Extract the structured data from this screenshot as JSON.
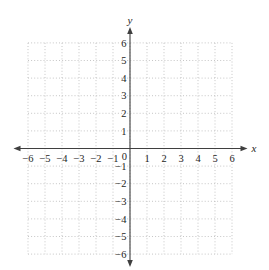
{
  "colors": {
    "axis": "#3f3f3f",
    "grid": "#bfbfbf",
    "text": "#262626",
    "background": "#ffffff"
  },
  "chart_data": {
    "type": "scatter",
    "title": "",
    "subtitle": "",
    "xlabel": "x",
    "ylabel": "y",
    "xlim": [
      -6,
      6
    ],
    "ylim": [
      -6,
      6
    ],
    "grid": "dotted",
    "grid_step": 1,
    "legend": "none",
    "x_ticks": [
      -6,
      -5,
      -4,
      -3,
      -2,
      -1,
      1,
      2,
      3,
      4,
      5,
      6
    ],
    "y_ticks": [
      6,
      5,
      4,
      3,
      2,
      1,
      -1,
      -2,
      -3,
      -4,
      -5,
      -6
    ],
    "origin_label": "0",
    "series": []
  }
}
